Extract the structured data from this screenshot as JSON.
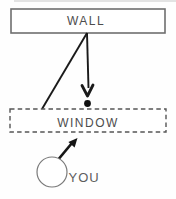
{
  "diagram": {
    "background_color": "#fefefe",
    "ink_color": "#1a1a1a",
    "border_color": "#6f6f6f",
    "dashed_border_color": "#555555",
    "text_color": "#4d4d4d",
    "nodes": {
      "wall": {
        "label": "WALL",
        "shape": "rectangle",
        "border": "solid"
      },
      "window": {
        "label": "WINDOW",
        "shape": "rectangle",
        "border": "dashed"
      },
      "you": {
        "label": "YOU",
        "shape": "circle"
      }
    },
    "edges": [
      {
        "from": "wall",
        "to": "window-top",
        "style": "plain-line"
      },
      {
        "from": "wall",
        "to": "dot-above-window",
        "style": "arrow-down"
      },
      {
        "from": "you",
        "to": "window",
        "style": "arrow-up-right"
      }
    ],
    "marks": {
      "dot_above_window": "filled black dot between wall arrow tip and window box"
    }
  }
}
